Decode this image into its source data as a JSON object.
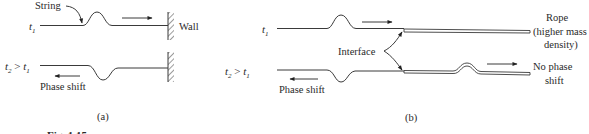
{
  "figure": {
    "caption_partial": "Fig. 1.15",
    "panel_a": {
      "label": "(a)",
      "top": {
        "time_label": "t",
        "time_sub": "1",
        "string_label": "String",
        "wall_label": "Wall",
        "pulse": "upward",
        "direction": "right"
      },
      "bottom": {
        "time_label_t2": "t",
        "time_sub2": "2",
        "gt": " > ",
        "time_label_t1": "t",
        "time_sub1": "1",
        "pulse": "inverted",
        "direction": "left",
        "annotation": "Phase shift"
      }
    },
    "panel_b": {
      "label": "(b)",
      "top": {
        "time_label": "t",
        "time_sub": "1",
        "rope_label_1": "Rope",
        "rope_label_2": "(higher mass",
        "rope_label_3": "density)",
        "pulse": "upward",
        "direction": "right"
      },
      "interface_label": "Interface",
      "bottom": {
        "time_label_t2": "t",
        "time_sub2": "2",
        "gt": " > ",
        "time_label_t1": "t",
        "time_sub1": "1",
        "reflected_pulse": "inverted",
        "reflected_direction": "left",
        "reflected_annotation": "Phase shift",
        "transmitted_pulse": "upward",
        "transmitted_direction": "right",
        "transmitted_annotation_1": "No phase",
        "transmitted_annotation_2": "shift"
      }
    }
  }
}
